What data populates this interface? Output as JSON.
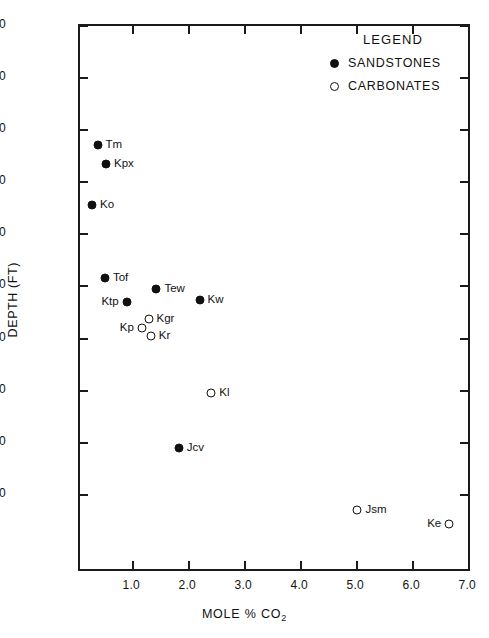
{
  "chart_data": {
    "type": "scatter",
    "title": "",
    "xlabel": "MOLE % CO2",
    "ylabel": "DEPTH (FT)",
    "xlim": [
      0.05,
      7.05
    ],
    "ylim": [
      2000,
      12500
    ],
    "y_inverted": true,
    "grid": false,
    "legend_position": "top-right",
    "xticks": [
      "1.0",
      "2.0",
      "3.0",
      "4.0",
      "5.0",
      "6.0",
      "7.0"
    ],
    "xtick_values": [
      1.0,
      2.0,
      3.0,
      4.0,
      5.0,
      6.0,
      7.0
    ],
    "yticks": [
      "2000",
      "3000",
      "4000",
      "5000",
      "6000",
      "7000",
      "8000",
      "9000",
      "10000",
      "11000"
    ],
    "ytick_values": [
      2000,
      3000,
      4000,
      5000,
      6000,
      7000,
      8000,
      9000,
      10000,
      11000
    ],
    "series": [
      {
        "name": "SANDSTONES",
        "marker": "filled-circle",
        "color": "#111111",
        "points": [
          {
            "label": "Tm",
            "x": 0.4,
            "y": 4320,
            "label_side": "right"
          },
          {
            "label": "Kpx",
            "x": 0.55,
            "y": 4690,
            "label_side": "right"
          },
          {
            "label": "Ko",
            "x": 0.3,
            "y": 5470,
            "label_side": "right"
          },
          {
            "label": "Tof",
            "x": 0.53,
            "y": 6870,
            "label_side": "right"
          },
          {
            "label": "Ktp",
            "x": 0.92,
            "y": 7340,
            "label_side": "left"
          },
          {
            "label": "Tew",
            "x": 1.45,
            "y": 7080,
            "label_side": "right"
          },
          {
            "label": "Kw",
            "x": 2.22,
            "y": 7300,
            "label_side": "right"
          },
          {
            "label": "Jcv",
            "x": 1.85,
            "y": 10130,
            "label_side": "right"
          }
        ]
      },
      {
        "name": "CARBONATES",
        "marker": "open-circle",
        "color": "#111111",
        "points": [
          {
            "label": "Kgr",
            "x": 1.31,
            "y": 7670,
            "label_side": "right"
          },
          {
            "label": "Kp",
            "x": 1.19,
            "y": 7840,
            "label_side": "left"
          },
          {
            "label": "Kr",
            "x": 1.35,
            "y": 7990,
            "label_side": "right"
          },
          {
            "label": "Kl",
            "x": 2.43,
            "y": 9080,
            "label_side": "right"
          },
          {
            "label": "Jsm",
            "x": 5.04,
            "y": 11330,
            "label_side": "right"
          },
          {
            "label": "Ke",
            "x": 6.68,
            "y": 11600,
            "label_side": "left"
          }
        ]
      }
    ]
  },
  "legend": {
    "title": "LEGEND",
    "entries": [
      {
        "label": "SANDSTONES",
        "marker": "filled-circle"
      },
      {
        "label": "CARBONATES",
        "marker": "open-circle"
      }
    ]
  },
  "axes": {
    "x_title_main": "MOLE  %  CO",
    "x_title_sub": "2",
    "y_title": "DEPTH (FT)"
  }
}
